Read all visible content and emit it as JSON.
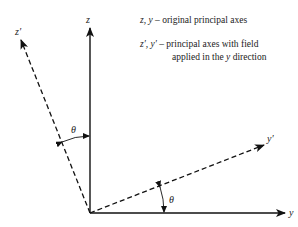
{
  "diagram": {
    "axes": {
      "z": "z",
      "y": "y",
      "z_prime": "z′",
      "y_prime": "y′"
    },
    "angles": {
      "theta_upper": "θ",
      "theta_lower": "θ"
    },
    "legend": {
      "line1_vars": "z, y",
      "line1_text": " – original principal axes",
      "line2_vars": "z′, y′",
      "line2_text": " – principal axes with field",
      "line3_text_a": "applied in the ",
      "line3_var": "y",
      "line3_text_b": " direction"
    },
    "colors": {
      "stroke": "#111111",
      "background": "#ffffff"
    }
  }
}
